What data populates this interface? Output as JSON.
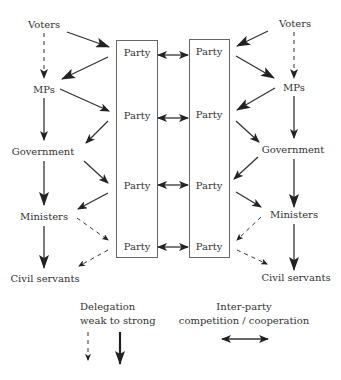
{
  "diagram": {
    "left_chain": {
      "voters": "Voters",
      "mps": "MPs",
      "government": "Government",
      "ministers": "Ministers",
      "civil_servants": "Civil servants"
    },
    "right_chain": {
      "voters": "Voters",
      "mps": "MPs",
      "government": "Government",
      "ministers": "Ministers",
      "civil_servants": "Civil servants"
    },
    "left_party_box": {
      "labels": [
        "Party",
        "Party",
        "Party",
        "Party"
      ]
    },
    "right_party_box": {
      "labels": [
        "Party",
        "Party",
        "Party",
        "Party"
      ]
    },
    "legend": {
      "delegation_line1": "Delegation",
      "delegation_line2": "weak to strong",
      "interparty_line1": "Inter-party",
      "interparty_line2": "competition / cooperation"
    },
    "colors": {
      "line": "#333333",
      "box_border": "#666666",
      "text": "#333333",
      "background": "#ffffff"
    }
  }
}
